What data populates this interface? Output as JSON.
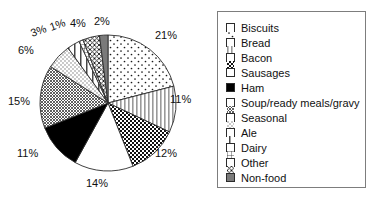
{
  "chart_data": {
    "type": "pie",
    "title": "",
    "categories": [
      "Biscuits",
      "Bread",
      "Bacon",
      "Sausages",
      "Ham",
      "Soup/ready meals/gravy",
      "Seasonal",
      "Ale",
      "Dairy",
      "Other",
      "Non-food"
    ],
    "values": [
      21,
      11,
      12,
      14,
      11,
      15,
      6,
      3,
      1,
      4,
      2
    ],
    "value_labels": [
      "21%",
      "11%",
      "12%",
      "14%",
      "11%",
      "15%",
      "6%",
      "3%",
      "1%",
      "4%",
      "2%"
    ],
    "unit": "%",
    "start_angle_deg": 0,
    "direction": "clockwise",
    "legend_position": "right",
    "grid": false,
    "slice_patterns": [
      "sparse-dots",
      "vertical-stripes",
      "checkerboard",
      "solid-white",
      "solid-black",
      "fine-crosshatch",
      "stipple-dots",
      "vertical-line",
      "grid",
      "diagonal-crosshatch",
      "solid-gray"
    ]
  },
  "pie": {
    "labels": [
      {
        "text": "21%",
        "x": 155,
        "y": 30,
        "rotate": 0
      },
      {
        "text": "11%",
        "x": 170,
        "y": 94,
        "rotate": 0
      },
      {
        "text": "12%",
        "x": 155,
        "y": 148,
        "rotate": 0
      },
      {
        "text": "14%",
        "x": 86,
        "y": 178,
        "rotate": 0
      },
      {
        "text": "11%",
        "x": 17,
        "y": 148,
        "rotate": 0
      },
      {
        "text": "15%",
        "x": 8,
        "y": 96,
        "rotate": 0
      },
      {
        "text": "6%",
        "x": 18,
        "y": 45,
        "rotate": 0
      },
      {
        "text": "3%",
        "x": 33,
        "y": 28,
        "rotate": -20
      },
      {
        "text": "1%",
        "x": 52,
        "y": 22,
        "rotate": -20
      },
      {
        "text": "4%",
        "x": 70,
        "y": 18,
        "rotate": 0
      },
      {
        "text": "2%",
        "x": 94,
        "y": 16,
        "rotate": 0
      }
    ]
  },
  "legend": {
    "items": [
      {
        "label": "Biscuits",
        "pattern": "sparse-dots"
      },
      {
        "label": "Bread",
        "pattern": "vertical-stripes"
      },
      {
        "label": "Bacon",
        "pattern": "checkerboard"
      },
      {
        "label": "Sausages",
        "pattern": "solid-white"
      },
      {
        "label": "Ham",
        "pattern": "solid-black"
      },
      {
        "label": "Soup/ready meals/gravy",
        "pattern": "fine-crosshatch"
      },
      {
        "label": "Seasonal",
        "pattern": "stipple-dots"
      },
      {
        "label": "Ale",
        "pattern": "vertical-line"
      },
      {
        "label": "Dairy",
        "pattern": "grid"
      },
      {
        "label": "Other",
        "pattern": "diagonal-crosshatch"
      },
      {
        "label": "Non-food",
        "pattern": "solid-gray"
      }
    ]
  },
  "colors": {
    "outline": "#2b2b2b",
    "legend_border": "#7d7d7d",
    "text": "#111111",
    "background": "#ffffff",
    "solid_black": "#000000",
    "solid_gray": "#7a7a7a"
  }
}
